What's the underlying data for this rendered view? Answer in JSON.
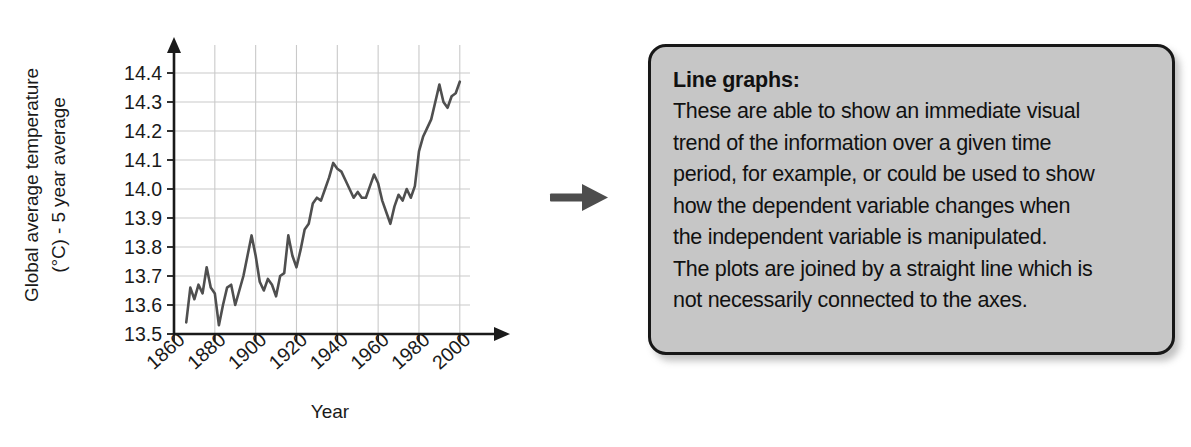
{
  "figure": {
    "y_axis_title_line1": "Global average temperature",
    "y_axis_title_line2": "(°C) - 5 year average",
    "x_axis_title": "Year"
  },
  "callout": {
    "title": "Line graphs:",
    "lines": [
      "These are able to show an immediate visual",
      "trend of the information over a given time",
      "period, for example, or could be used to show",
      "how the dependent variable changes when",
      "the independent variable is manipulated.",
      "The plots are joined by a straight line which is",
      "not necessarily connected to the axes."
    ],
    "fill_color": "#c6c6c6",
    "border_color": "#171717"
  },
  "arrow": {
    "direction": "right",
    "color": "#4d4d4d"
  },
  "chart_data": {
    "type": "line",
    "title": "",
    "xlabel": "Year",
    "ylabel": "Global average temperature (°C) - 5 year average",
    "xlim": [
      1860,
      2005
    ],
    "ylim": [
      13.5,
      14.45
    ],
    "xticks": [
      1860,
      1880,
      1900,
      1920,
      1940,
      1960,
      1980,
      2000
    ],
    "yticks": [
      13.5,
      13.6,
      13.7,
      13.8,
      13.9,
      14.0,
      14.1,
      14.2,
      14.3,
      14.4
    ],
    "grid": true,
    "legend": "none",
    "line_color": "#4f4f4f",
    "grid_color": "#c9c9c9",
    "axis_color": "#1a1a1a",
    "series": [
      {
        "name": "Global average temperature (5 year average)",
        "x": [
          1866,
          1868,
          1870,
          1872,
          1874,
          1876,
          1878,
          1880,
          1882,
          1884,
          1886,
          1888,
          1890,
          1892,
          1894,
          1896,
          1898,
          1900,
          1902,
          1904,
          1906,
          1908,
          1910,
          1912,
          1914,
          1916,
          1918,
          1920,
          1922,
          1924,
          1926,
          1928,
          1930,
          1932,
          1934,
          1936,
          1938,
          1940,
          1942,
          1944,
          1946,
          1948,
          1950,
          1952,
          1954,
          1956,
          1958,
          1960,
          1962,
          1964,
          1966,
          1968,
          1970,
          1972,
          1974,
          1976,
          1978,
          1980,
          1982,
          1984,
          1986,
          1988,
          1990,
          1992,
          1994,
          1996,
          1998,
          2000
        ],
        "y": [
          13.54,
          13.66,
          13.62,
          13.67,
          13.64,
          13.73,
          13.66,
          13.64,
          13.53,
          13.6,
          13.66,
          13.67,
          13.6,
          13.65,
          13.7,
          13.77,
          13.84,
          13.77,
          13.68,
          13.65,
          13.69,
          13.67,
          13.63,
          13.7,
          13.71,
          13.84,
          13.77,
          13.73,
          13.79,
          13.86,
          13.88,
          13.95,
          13.97,
          13.96,
          14.0,
          14.04,
          14.09,
          14.07,
          14.06,
          14.03,
          14.0,
          13.97,
          13.99,
          13.97,
          13.97,
          14.01,
          14.05,
          14.02,
          13.96,
          13.92,
          13.88,
          13.94,
          13.98,
          13.96,
          14.0,
          13.97,
          14.01,
          14.13,
          14.18,
          14.21,
          14.24,
          14.3,
          14.36,
          14.3,
          14.28,
          14.32,
          14.33,
          14.37
        ]
      }
    ]
  }
}
